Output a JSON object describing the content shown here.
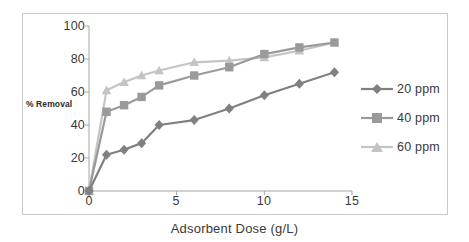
{
  "chart_data": {
    "type": "line",
    "title": "",
    "xlabel": "Adsorbent Dose (g/L)",
    "ylabel": "% Removal",
    "xlim": [
      0,
      15
    ],
    "ylim": [
      0,
      100
    ],
    "xticks": [
      0,
      5,
      10,
      15
    ],
    "yticks": [
      0,
      20,
      40,
      60,
      80,
      100
    ],
    "grid": false,
    "legend_position": "right",
    "x": [
      0,
      1,
      2,
      3,
      4,
      6,
      8,
      10,
      12,
      14
    ],
    "series": [
      {
        "name": "20 ppm",
        "marker": "diamond",
        "color": "#808080",
        "values": [
          0,
          22,
          25,
          29,
          40,
          43,
          50,
          58,
          65,
          72
        ]
      },
      {
        "name": "40 ppm",
        "marker": "square",
        "color": "#9a9a9a",
        "values": [
          0,
          48,
          52,
          57,
          64,
          70,
          75,
          83,
          87,
          90
        ]
      },
      {
        "name": "60 ppm",
        "marker": "triangle",
        "color": "#c4c4c4",
        "values": [
          0,
          61,
          66,
          70,
          73,
          78,
          79,
          81,
          85,
          90
        ]
      }
    ]
  },
  "axis": {
    "ytick_labels": [
      "100",
      "80",
      "60",
      "40",
      "20",
      "0"
    ],
    "xtick_labels": [
      "0",
      "5",
      "10",
      "15"
    ]
  },
  "legend": {
    "items": [
      {
        "label": "20 ppm"
      },
      {
        "label": "40 ppm"
      },
      {
        "label": "60 ppm"
      }
    ]
  },
  "colors": {
    "frame": "#c9c9c9",
    "axis": "#a6a6a6",
    "text": "#3a3a3a",
    "series_20": "#808080",
    "series_40": "#9a9a9a",
    "series_60": "#c4c4c4"
  }
}
